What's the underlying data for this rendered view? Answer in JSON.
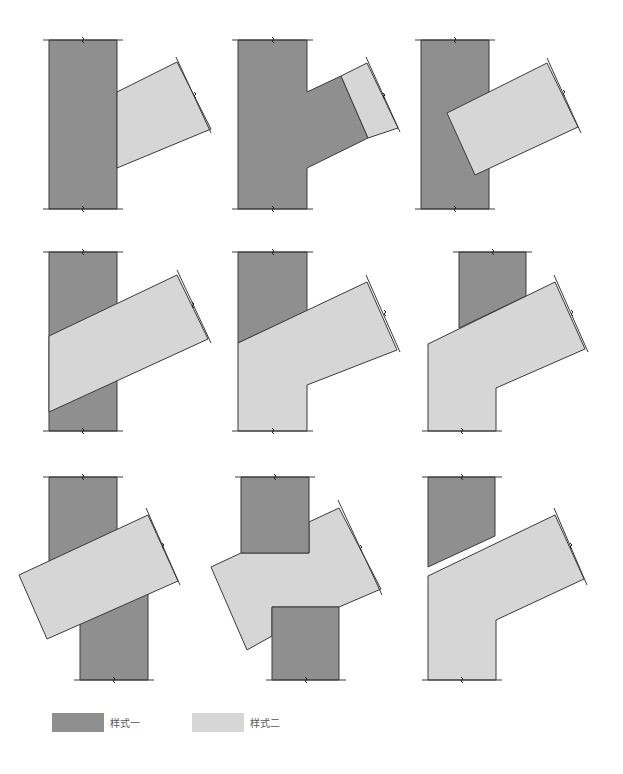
{
  "colors": {
    "style1": "#8f8f8f",
    "style2": "#d6d6d6",
    "stroke": "#3a3a3a"
  },
  "legend": {
    "items": [
      {
        "label": "样式一",
        "style": "style1"
      },
      {
        "label": "样式二",
        "style": "style2"
      }
    ]
  },
  "panels": [
    {
      "id": "r1c1",
      "shapes": [
        {
          "style": "style1",
          "points": "49,40 117,40 117,209 49,209"
        },
        {
          "style": "style2",
          "points": "117,92 177,62 211,129 117,168"
        }
      ],
      "guides": [
        [
          43,
          40,
          123,
          40
        ],
        [
          43,
          209,
          123,
          209
        ],
        [
          176,
          57,
          211,
          133
        ]
      ],
      "ticks": [
        [
          83,
          40
        ],
        [
          83,
          209
        ],
        [
          195,
          95
        ]
      ]
    },
    {
      "id": "r1c2",
      "shapes": [
        {
          "style": "style1",
          "points": "238,40 307,40 307,92 341,76 368,138 307,168 307,209 238,209"
        },
        {
          "style": "style2",
          "points": "341,76 367,63 398,128 368,138"
        }
      ],
      "guides": [
        [
          232,
          40,
          313,
          40
        ],
        [
          232,
          209,
          313,
          209
        ],
        [
          366,
          57,
          400,
          132
        ]
      ],
      "ticks": [
        [
          273,
          40
        ],
        [
          273,
          209
        ],
        [
          384,
          96
        ]
      ]
    },
    {
      "id": "r1c3",
      "shapes": [
        {
          "style": "style1",
          "points": "421,40 489,40 489,209 421,209"
        },
        {
          "style": "style2",
          "points": "447,113 547,63 578,127 475,175"
        }
      ],
      "guides": [
        [
          415,
          40,
          495,
          40
        ],
        [
          415,
          209,
          495,
          209
        ],
        [
          547,
          58,
          581,
          133
        ]
      ],
      "ticks": [
        [
          455,
          40
        ],
        [
          455,
          209
        ],
        [
          564,
          93
        ]
      ]
    },
    {
      "id": "r2c1",
      "shapes": [
        {
          "style": "style1",
          "points": "49,252 117,252 117,431 49,431"
        },
        {
          "style": "style2",
          "points": "49,336 177,275 208,339 49,412"
        }
      ],
      "guides": [
        [
          43,
          252,
          123,
          252
        ],
        [
          43,
          431,
          123,
          431
        ],
        [
          177,
          270,
          211,
          343
        ]
      ],
      "ticks": [
        [
          83,
          252
        ],
        [
          83,
          431
        ],
        [
          193,
          305
        ]
      ]
    },
    {
      "id": "r2c2",
      "shapes": [
        {
          "style": "style1",
          "points": "238,252 307,252 307,311 238,343"
        },
        {
          "style": "style2",
          "points": "238,343 367,282 397,350 307,385 307,431 238,431"
        }
      ],
      "guides": [
        [
          232,
          252,
          313,
          252
        ],
        [
          232,
          431,
          313,
          431
        ],
        [
          366,
          275,
          400,
          352
        ]
      ],
      "ticks": [
        [
          273,
          252
        ],
        [
          273,
          431
        ],
        [
          385,
          313
        ]
      ]
    },
    {
      "id": "r2c3",
      "shapes": [
        {
          "style": "style1",
          "points": "459,252 526,252 526,296 459,328"
        },
        {
          "style": "style2",
          "points": "428,344 555,282 585,349 496,388 496,431 428,431"
        }
      ],
      "guides": [
        [
          453,
          252,
          532,
          252
        ],
        [
          422,
          431,
          502,
          431
        ],
        [
          554,
          275,
          588,
          352
        ]
      ],
      "ticks": [
        [
          493,
          252
        ],
        [
          462,
          431
        ],
        [
          572,
          313
        ]
      ]
    },
    {
      "id": "r3c1",
      "shapes": [
        {
          "style": "style1",
          "points": "49,477 117,477 117,530 49,562"
        },
        {
          "style": "style1",
          "points": "80,592 148,592 148,680 80,680"
        },
        {
          "style": "style2",
          "points": "19,575 148,515 178,581 47,639"
        }
      ],
      "guides": [
        [
          43,
          477,
          123,
          477
        ],
        [
          74,
          680,
          154,
          680
        ],
        [
          146,
          508,
          180,
          585
        ]
      ],
      "ticks": [
        [
          83,
          477
        ],
        [
          114,
          680
        ],
        [
          163,
          546
        ]
      ]
    },
    {
      "id": "r3c2",
      "shapes": [
        {
          "style": "style2",
          "points": "211,567 241,553 309,553 309,522 339,508 381,589 339,607 272,607 272,636 247,650"
        },
        {
          "style": "style1",
          "points": "241,477 309,477 309,553 241,553"
        },
        {
          "style": "style1",
          "points": "272,607 339,607 339,680 272,680"
        }
      ],
      "guides": [
        [
          235,
          477,
          315,
          477
        ],
        [
          266,
          680,
          346,
          680
        ],
        [
          338,
          500,
          382,
          595
        ]
      ],
      "ticks": [
        [
          275,
          477
        ],
        [
          306,
          680
        ],
        [
          361,
          548
        ]
      ]
    },
    {
      "id": "r3c3",
      "shapes": [
        {
          "style": "style1",
          "points": "428,477 495,477 495,536 428,567"
        },
        {
          "style": "style2",
          "points": "428,576 555,515 584,579 496,620 496,680 428,680"
        }
      ],
      "guides": [
        [
          422,
          477,
          502,
          477
        ],
        [
          422,
          680,
          502,
          680
        ],
        [
          554,
          508,
          587,
          585
        ]
      ],
      "ticks": [
        [
          462,
          477
        ],
        [
          462,
          680
        ],
        [
          571,
          546
        ]
      ]
    }
  ]
}
